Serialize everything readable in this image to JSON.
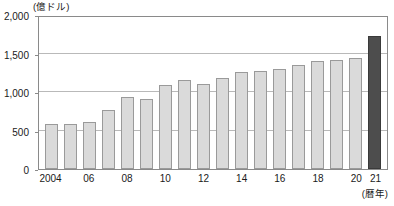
{
  "chart_data": {
    "type": "bar",
    "title": "",
    "xlabel": "(暦年)",
    "ylabel": "(億ドル)",
    "ylim": [
      0,
      2000
    ],
    "yticks": [
      0,
      500,
      1000,
      1500,
      2000
    ],
    "ytick_labels": [
      "0",
      "500",
      "1,000",
      "1,500",
      "2,000"
    ],
    "grid": true,
    "legend": "none",
    "categories": [
      "2004",
      "2005",
      "2006",
      "2007",
      "2008",
      "2009",
      "2010",
      "2011",
      "2012",
      "2013",
      "2014",
      "2015",
      "2016",
      "2017",
      "2018",
      "2019",
      "2020",
      "2021"
    ],
    "xtick_labels": [
      "2004",
      "06",
      "08",
      "10",
      "12",
      "14",
      "16",
      "18",
      "20",
      "21"
    ],
    "values": [
      590,
      590,
      610,
      760,
      940,
      910,
      1090,
      1160,
      1110,
      1180,
      1260,
      1270,
      1300,
      1350,
      1400,
      1420,
      1440,
      1730
    ],
    "bar_colors": {
      "default": "#dadada",
      "default_border": "#9a9a9a",
      "highlight": "#4d4d4d",
      "highlight_border": "#3a3a3a"
    },
    "highlight_category": "2021",
    "axis_color": "#8a8a8a",
    "grid_color": "#b9b9b9"
  }
}
